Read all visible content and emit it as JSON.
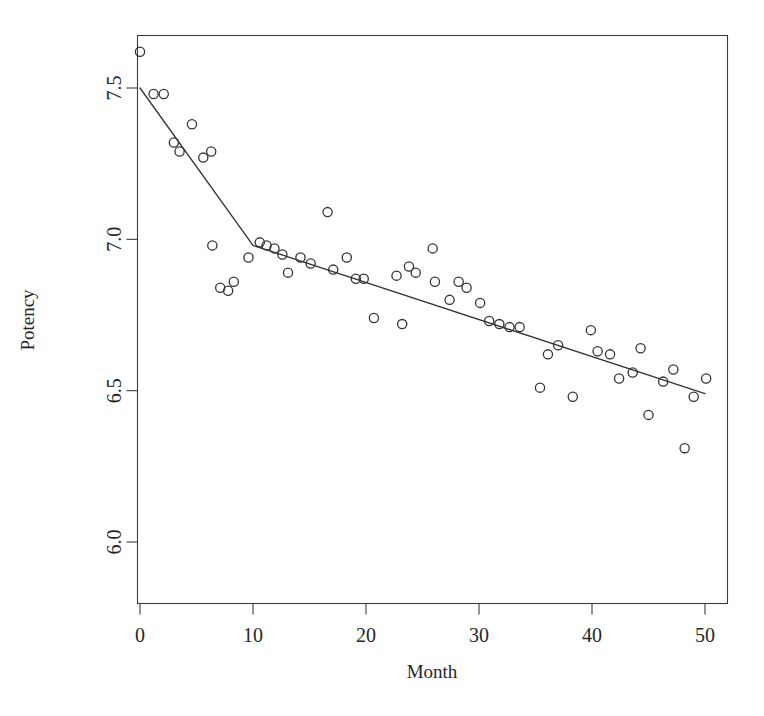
{
  "chart_data": {
    "type": "scatter",
    "title": "",
    "xlabel": "Month",
    "ylabel": "Potency",
    "xlim": [
      -1.5,
      52.0
    ],
    "ylim": [
      5.94,
      7.68
    ],
    "grid": false,
    "legend": null,
    "xticks": [
      0,
      10,
      20,
      30,
      40,
      50
    ],
    "xtick_labels": [
      "0",
      "10",
      "20",
      "30",
      "40",
      "50"
    ],
    "yticks": [
      6.0,
      6.5,
      7.0,
      7.5
    ],
    "ytick_labels": [
      "6.0",
      "6.5",
      "7.0",
      "7.5"
    ],
    "marker": "open-circle",
    "marker_color": "#333333",
    "line_color": "#333333",
    "points": [
      {
        "x": 0.0,
        "y": 7.62
      },
      {
        "x": 1.2,
        "y": 7.48
      },
      {
        "x": 2.1,
        "y": 7.48
      },
      {
        "x": 3.0,
        "y": 7.32
      },
      {
        "x": 3.5,
        "y": 7.29
      },
      {
        "x": 4.6,
        "y": 7.38
      },
      {
        "x": 5.6,
        "y": 7.27
      },
      {
        "x": 6.3,
        "y": 7.29
      },
      {
        "x": 6.4,
        "y": 6.98
      },
      {
        "x": 7.1,
        "y": 6.84
      },
      {
        "x": 7.8,
        "y": 6.83
      },
      {
        "x": 8.3,
        "y": 6.86
      },
      {
        "x": 9.6,
        "y": 6.94
      },
      {
        "x": 10.6,
        "y": 6.99
      },
      {
        "x": 11.2,
        "y": 6.98
      },
      {
        "x": 11.9,
        "y": 6.97
      },
      {
        "x": 12.6,
        "y": 6.95
      },
      {
        "x": 13.1,
        "y": 6.89
      },
      {
        "x": 14.2,
        "y": 6.94
      },
      {
        "x": 15.1,
        "y": 6.92
      },
      {
        "x": 16.6,
        "y": 7.09
      },
      {
        "x": 17.1,
        "y": 6.9
      },
      {
        "x": 18.3,
        "y": 6.94
      },
      {
        "x": 19.1,
        "y": 6.87
      },
      {
        "x": 19.8,
        "y": 6.87
      },
      {
        "x": 20.7,
        "y": 6.74
      },
      {
        "x": 22.7,
        "y": 6.88
      },
      {
        "x": 23.2,
        "y": 6.72
      },
      {
        "x": 23.8,
        "y": 6.91
      },
      {
        "x": 24.4,
        "y": 6.89
      },
      {
        "x": 25.9,
        "y": 6.97
      },
      {
        "x": 26.1,
        "y": 6.86
      },
      {
        "x": 27.4,
        "y": 6.8
      },
      {
        "x": 28.2,
        "y": 6.86
      },
      {
        "x": 28.9,
        "y": 6.84
      },
      {
        "x": 30.1,
        "y": 6.79
      },
      {
        "x": 30.9,
        "y": 6.73
      },
      {
        "x": 31.8,
        "y": 6.72
      },
      {
        "x": 32.7,
        "y": 6.71
      },
      {
        "x": 33.6,
        "y": 6.71
      },
      {
        "x": 35.4,
        "y": 6.51
      },
      {
        "x": 36.1,
        "y": 6.62
      },
      {
        "x": 37.0,
        "y": 6.65
      },
      {
        "x": 38.3,
        "y": 6.48
      },
      {
        "x": 39.9,
        "y": 6.7
      },
      {
        "x": 40.5,
        "y": 6.63
      },
      {
        "x": 41.6,
        "y": 6.62
      },
      {
        "x": 42.4,
        "y": 6.54
      },
      {
        "x": 43.6,
        "y": 6.56
      },
      {
        "x": 44.3,
        "y": 6.64
      },
      {
        "x": 45.0,
        "y": 6.42
      },
      {
        "x": 46.3,
        "y": 6.53
      },
      {
        "x": 47.2,
        "y": 6.57
      },
      {
        "x": 48.2,
        "y": 6.31
      },
      {
        "x": 49.0,
        "y": 6.48
      },
      {
        "x": 50.1,
        "y": 6.54
      }
    ],
    "fit": {
      "type": "piecewise-linear",
      "breakpoint_x": 10.0,
      "breakpoint_y": 6.98,
      "segments": [
        {
          "x0": 0.0,
          "y0": 7.5,
          "x1": 10.0,
          "y1": 6.98
        },
        {
          "x0": 10.0,
          "y0": 6.98,
          "x1": 50.0,
          "y1": 6.49
        }
      ]
    }
  }
}
